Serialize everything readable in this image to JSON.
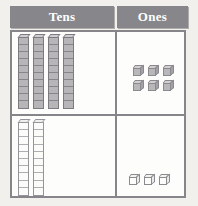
{
  "chart_data": {
    "type": "table",
    "columns": [
      "Tens",
      "Ones"
    ],
    "rows": [
      {
        "label": "row-1",
        "tens_rods": 4,
        "ones_cubes": 6,
        "tens_value": 40,
        "ones_value": 6,
        "number": 46,
        "style": "shaded"
      },
      {
        "label": "row-2",
        "tens_rods": 2,
        "ones_cubes": 3,
        "tens_value": 20,
        "ones_value": 3,
        "number": 23,
        "style": "outline"
      }
    ],
    "units_per_rod": 10,
    "colors": {
      "header_background": "#87868a",
      "header_text": "#ffffff",
      "grid_border": "#86858a",
      "cell_background": "#fdfdfb",
      "page_background": "#f2f0ec",
      "block_shaded": "#b7b5b8",
      "block_outline": "#fbfbf9"
    }
  },
  "headers": {
    "tens": "Tens",
    "ones": "Ones"
  },
  "manipulatives": {
    "rod_icon": "base-ten-rod-icon",
    "cube_icon": "unit-cube-icon"
  }
}
